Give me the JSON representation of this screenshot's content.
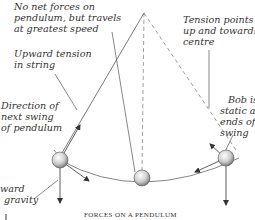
{
  "diagram": {
    "caption": "FORCES ON A PENDULUM",
    "labels": {
      "no_net_forces": [
        "No net forces on",
        "pendulum, but travels",
        "at greatest speed"
      ],
      "upward_tension": [
        "Upward tension",
        "in string"
      ],
      "direction_next_swing": [
        "Direction of",
        "next swing",
        "of pendulum"
      ],
      "downward_gravity": [
        "ward",
        "gravity"
      ],
      "tension_points": [
        "Tension points",
        "up and towards",
        "centre"
      ],
      "bob_static": [
        "Bob is",
        "static at",
        "ends of",
        "swing"
      ]
    },
    "colors": {
      "line": "#555555",
      "text": "#333333",
      "bob_fill": "#d9d9d9",
      "bob_shade": "#888888"
    }
  }
}
